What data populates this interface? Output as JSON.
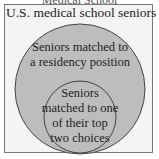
{
  "diagram": {
    "top_caption_cut": "Medical School",
    "universe_label": "U.S. medical school seniors",
    "outer_set_label_line1": "Seniors matched to",
    "outer_set_label_line2": "a residency position",
    "inner_set_label_line1": "Seniors",
    "inner_set_label_line2": "matched to one",
    "inner_set_label_line3": "of their top",
    "inner_set_label_line4": "two choices",
    "colors": {
      "box_fill": "#f4f4f4",
      "circle_fill": "#bdbdbd",
      "stroke": "#444444"
    }
  }
}
